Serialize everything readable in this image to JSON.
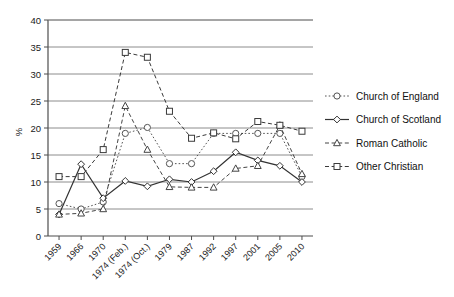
{
  "chart_data": {
    "type": "line",
    "title": "",
    "xlabel": "",
    "ylabel": "%",
    "ylim": [
      0,
      40
    ],
    "ytick_step": 5,
    "yticks": [
      "0",
      "5",
      "10",
      "15",
      "20",
      "25",
      "30",
      "35",
      "40"
    ],
    "grid": "horizontal",
    "legend_position": "right",
    "categories": [
      "1959",
      "1966",
      "1970",
      "1974 (Feb.)",
      "1974 (Oct.)",
      "1979",
      "1987",
      "1992",
      "1997",
      "2001",
      "2005",
      "2010"
    ],
    "series": [
      {
        "name": "Church of England",
        "marker": "circle",
        "line_style": "dotted",
        "color": "#555555",
        "values": [
          6.0,
          5.0,
          6.3,
          19.0,
          20.1,
          13.4,
          13.4,
          19.0,
          19.0,
          19.0,
          19.0,
          11.0
        ]
      },
      {
        "name": "Church of Scotland",
        "marker": "diamond",
        "line_style": "solid",
        "color": "#333333",
        "values": [
          4.0,
          13.3,
          7.0,
          10.2,
          9.2,
          10.5,
          10.0,
          12.0,
          15.5,
          14.0,
          13.0,
          10.0
        ]
      },
      {
        "name": "Roman Catholic",
        "marker": "triangle",
        "line_style": "dashed",
        "color": "#444444",
        "values": [
          4.0,
          4.2,
          5.0,
          24.1,
          16.0,
          9.1,
          9.0,
          9.0,
          12.5,
          13.0,
          20.5,
          11.5
        ]
      },
      {
        "name": "Other Christian",
        "marker": "square",
        "line_style": "dashed",
        "color": "#3a3a3a",
        "values": [
          11.0,
          11.0,
          16.0,
          34.0,
          33.1,
          23.1,
          18.1,
          19.1,
          18.0,
          21.2,
          20.5,
          19.4
        ]
      }
    ]
  },
  "legend": {
    "items": [
      {
        "label": "Church of England"
      },
      {
        "label": "Church of Scotland"
      },
      {
        "label": "Roman Catholic"
      },
      {
        "label": "Other Christian"
      }
    ]
  },
  "style": {
    "grid_color": "#808080",
    "axis_color": "#4d4d4d",
    "background": "#ffffff"
  }
}
